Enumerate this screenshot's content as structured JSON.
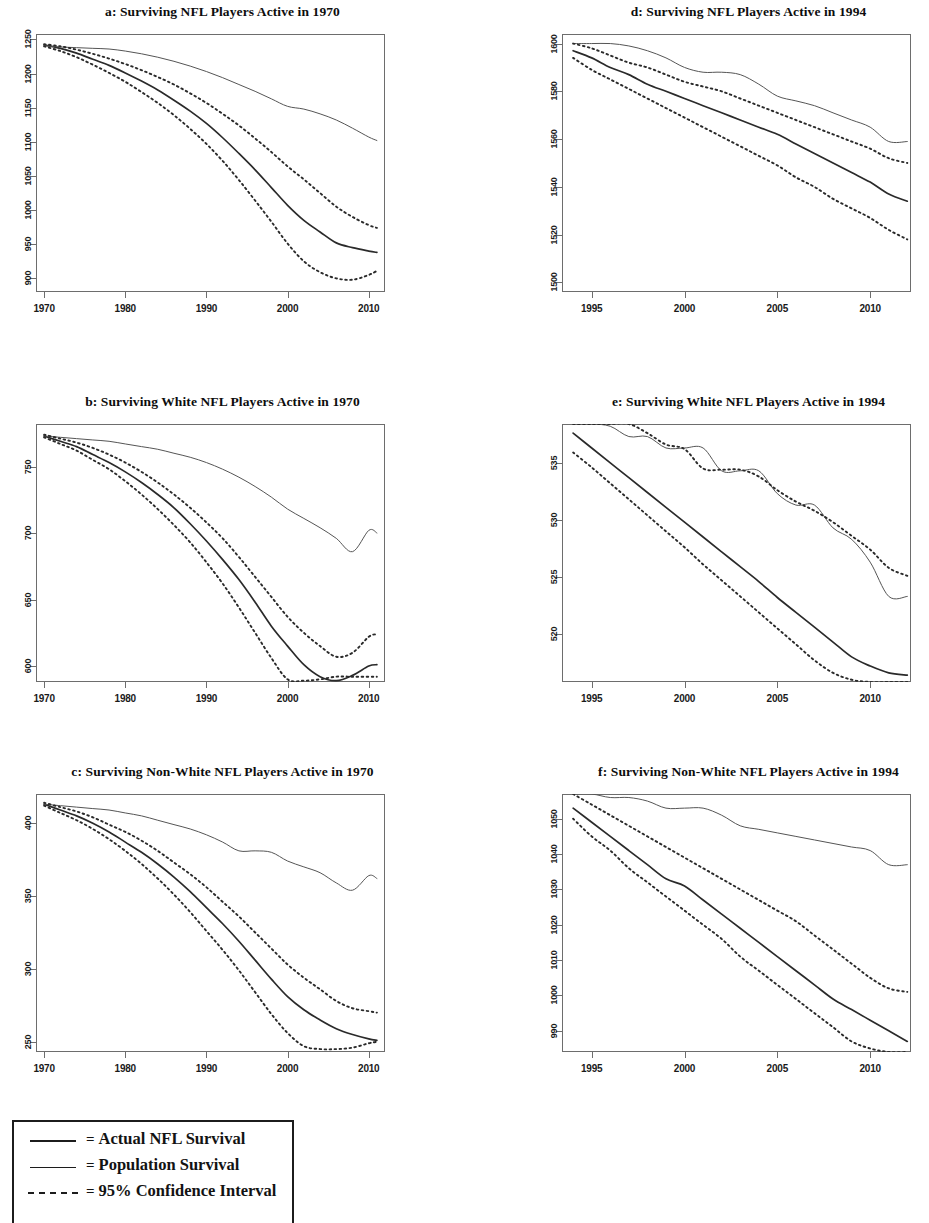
{
  "figure": {
    "panel_order": [
      "a",
      "b",
      "c",
      "d",
      "e",
      "f"
    ]
  },
  "legend": {
    "entries": [
      {
        "style": "solid-thick",
        "eq": "=",
        "label": "Actual NFL Survival"
      },
      {
        "style": "solid-thin",
        "eq": "=",
        "label": "Population Survival"
      },
      {
        "style": "dashed",
        "eq": "=",
        "label": "95% Confidence Interval"
      }
    ]
  },
  "chart_data": [
    {
      "id": "a",
      "type": "line",
      "title": "a: Surviving NFL Players Active in 1970",
      "xlabel": "",
      "ylabel": "",
      "grid": false,
      "legend_position": "external-below",
      "xlim": [
        1969,
        2012
      ],
      "ylim": [
        880,
        1258
      ],
      "xticks": [
        1970,
        1980,
        1990,
        2000,
        2010
      ],
      "yticks": [
        900,
        950,
        1000,
        1050,
        1100,
        1150,
        1200,
        1250
      ],
      "x": [
        1970,
        1972,
        1974,
        1976,
        1978,
        1980,
        1982,
        1984,
        1986,
        1988,
        1990,
        1992,
        1994,
        1996,
        1998,
        2000,
        2002,
        2004,
        2006,
        2008,
        2010,
        2011
      ],
      "series": [
        {
          "name": "Actual NFL Survival",
          "style": "solid-thick",
          "values": [
            1242,
            1237,
            1230,
            1221,
            1212,
            1201,
            1189,
            1176,
            1161,
            1145,
            1127,
            1106,
            1083,
            1059,
            1033,
            1007,
            985,
            968,
            952,
            945,
            940,
            938
          ]
        },
        {
          "name": "Population Survival",
          "style": "solid-thin",
          "values": [
            1241,
            1239,
            1238,
            1237,
            1236,
            1233,
            1229,
            1224,
            1218,
            1211,
            1203,
            1194,
            1184,
            1174,
            1163,
            1152,
            1148,
            1141,
            1132,
            1120,
            1107,
            1102
          ]
        },
        {
          "name": "95% CI upper",
          "style": "dashed",
          "values": [
            1243,
            1240,
            1235,
            1229,
            1222,
            1214,
            1205,
            1195,
            1184,
            1171,
            1157,
            1141,
            1124,
            1105,
            1085,
            1064,
            1045,
            1025,
            1005,
            990,
            978,
            974
          ]
        },
        {
          "name": "95% CI lower",
          "style": "dashed",
          "values": [
            1240,
            1233,
            1224,
            1213,
            1201,
            1188,
            1173,
            1157,
            1139,
            1119,
            1097,
            1072,
            1044,
            1014,
            983,
            951,
            925,
            909,
            900,
            898,
            905,
            911
          ]
        }
      ]
    },
    {
      "id": "b",
      "type": "line",
      "title": "b: Surviving White NFL Players Active in 1970",
      "xlabel": "",
      "ylabel": "",
      "grid": false,
      "legend_position": "external-below",
      "xlim": [
        1969,
        2012
      ],
      "ylim": [
        588,
        782
      ],
      "xticks": [
        1970,
        1980,
        1990,
        2000,
        2010
      ],
      "yticks": [
        600,
        650,
        700,
        750
      ],
      "x": [
        1970,
        1972,
        1974,
        1976,
        1978,
        1980,
        1982,
        1984,
        1986,
        1988,
        1990,
        1992,
        1994,
        1996,
        1998,
        2000,
        2002,
        2004,
        2006,
        2008,
        2010,
        2011
      ],
      "series": [
        {
          "name": "Actual NFL Survival",
          "style": "solid-thick",
          "values": [
            773,
            769,
            765,
            759,
            753,
            746,
            738,
            729,
            719,
            707,
            694,
            680,
            665,
            648,
            630,
            615,
            601,
            592,
            589,
            593,
            600,
            601
          ]
        },
        {
          "name": "Population Survival",
          "style": "solid-thin",
          "values": [
            773,
            772,
            771,
            770,
            769,
            767,
            765,
            763,
            760,
            757,
            753,
            748,
            742,
            735,
            727,
            718,
            711,
            704,
            696,
            686,
            702,
            700
          ]
        },
        {
          "name": "95% CI upper",
          "style": "dashed",
          "values": [
            774,
            771,
            768,
            764,
            759,
            753,
            746,
            738,
            729,
            719,
            708,
            696,
            682,
            667,
            652,
            637,
            625,
            615,
            607,
            610,
            622,
            624
          ]
        },
        {
          "name": "95% CI lower",
          "style": "dashed",
          "values": [
            772,
            767,
            762,
            755,
            748,
            739,
            729,
            718,
            706,
            693,
            678,
            662,
            644,
            625,
            606,
            590,
            589,
            590,
            592,
            592,
            592,
            592
          ]
        }
      ]
    },
    {
      "id": "c",
      "type": "line",
      "title": "c: Surviving Non-White NFL Players Active in 1970",
      "xlabel": "",
      "ylabel": "",
      "grid": false,
      "legend_position": "external-below",
      "xlim": [
        1969,
        2012
      ],
      "ylim": [
        243,
        420
      ],
      "xticks": [
        1970,
        1980,
        1990,
        2000,
        2010
      ],
      "yticks": [
        250,
        300,
        350,
        400
      ],
      "x": [
        1970,
        1972,
        1974,
        1976,
        1978,
        1980,
        1982,
        1984,
        1986,
        1988,
        1990,
        1992,
        1994,
        1996,
        1998,
        2000,
        2002,
        2004,
        2006,
        2008,
        2010,
        2011
      ],
      "series": [
        {
          "name": "Actual NFL Survival",
          "style": "solid-thick",
          "values": [
            413,
            409,
            405,
            400,
            394,
            387,
            380,
            372,
            363,
            353,
            342,
            331,
            319,
            306,
            293,
            281,
            272,
            265,
            259,
            255,
            252,
            251
          ]
        },
        {
          "name": "Population Survival",
          "style": "solid-thin",
          "values": [
            413,
            412,
            411,
            410,
            409,
            407,
            405,
            402,
            399,
            396,
            392,
            387,
            381,
            381,
            380,
            374,
            370,
            366,
            359,
            354,
            364,
            362
          ]
        },
        {
          "name": "95% CI upper",
          "style": "dashed",
          "values": [
            414,
            411,
            408,
            404,
            399,
            394,
            388,
            381,
            373,
            365,
            356,
            346,
            336,
            325,
            314,
            303,
            294,
            286,
            278,
            273,
            271,
            270
          ]
        },
        {
          "name": "95% CI lower",
          "style": "dashed",
          "values": [
            412,
            407,
            402,
            396,
            389,
            381,
            372,
            362,
            351,
            339,
            326,
            313,
            299,
            284,
            269,
            256,
            247,
            245,
            245,
            246,
            249,
            250
          ]
        }
      ]
    },
    {
      "id": "d",
      "type": "line",
      "title": "d: Surviving NFL Players Active in 1994",
      "xlabel": "",
      "ylabel": "",
      "grid": false,
      "legend_position": "external-below",
      "xlim": [
        1993.4,
        2012.2
      ],
      "ylim": [
        1496,
        1604
      ],
      "xticks": [
        1995,
        2000,
        2005,
        2010
      ],
      "yticks": [
        1500,
        1520,
        1540,
        1560,
        1580,
        1600
      ],
      "x": [
        1994,
        1995,
        1996,
        1997,
        1998,
        1999,
        2000,
        2001,
        2002,
        2003,
        2004,
        2005,
        2006,
        2007,
        2008,
        2009,
        2010,
        2011,
        2012
      ],
      "series": [
        {
          "name": "Actual NFL Survival",
          "style": "solid-thick",
          "values": [
            1597,
            1594,
            1590,
            1587,
            1583,
            1580,
            1577,
            1574,
            1571,
            1568,
            1565,
            1562,
            1558,
            1554,
            1550,
            1546,
            1542,
            1537,
            1534
          ]
        },
        {
          "name": "Population Survival",
          "style": "solid-thin",
          "values": [
            1600,
            1600,
            1600,
            1599,
            1597,
            1594,
            1590,
            1588,
            1588,
            1587,
            1583,
            1578,
            1576,
            1574,
            1571,
            1568,
            1565,
            1559,
            1559
          ]
        },
        {
          "name": "95% CI upper",
          "style": "dashed",
          "values": [
            1600,
            1598,
            1595,
            1592,
            1590,
            1587,
            1584,
            1582,
            1580,
            1577,
            1574,
            1571,
            1568,
            1565,
            1562,
            1559,
            1556,
            1552,
            1550
          ]
        },
        {
          "name": "95% CI lower",
          "style": "dashed",
          "values": [
            1594,
            1589,
            1585,
            1581,
            1577,
            1573,
            1569,
            1565,
            1561,
            1557,
            1553,
            1549,
            1544,
            1540,
            1535,
            1531,
            1527,
            1522,
            1518
          ]
        }
      ]
    },
    {
      "id": "e",
      "type": "line",
      "title": "e: Surviving White NFL Players Active in 1994",
      "xlabel": "",
      "ylabel": "",
      "grid": false,
      "legend_position": "external-below",
      "xlim": [
        1993.4,
        2012.2
      ],
      "ylim": [
        515.8,
        538.4
      ],
      "xticks": [
        1995,
        2000,
        2005,
        2010
      ],
      "yticks": [
        520,
        525,
        530,
        535
      ],
      "x": [
        1994,
        1995,
        1996,
        1997,
        1998,
        1999,
        2000,
        2001,
        2002,
        2003,
        2004,
        2005,
        2006,
        2007,
        2008,
        2009,
        2010,
        2011,
        2012
      ],
      "series": [
        {
          "name": "Actual NFL Survival",
          "style": "solid-thick",
          "values": [
            537.6,
            536.3,
            535.0,
            533.7,
            532.4,
            531.1,
            529.8,
            528.5,
            527.2,
            525.9,
            524.6,
            523.2,
            521.9,
            520.6,
            519.3,
            518.0,
            517.2,
            516.6,
            516.4
          ]
        },
        {
          "name": "Population Survival",
          "style": "solid-thin",
          "values": [
            538.4,
            538.4,
            538.2,
            537.3,
            537.3,
            536.3,
            536.3,
            536.3,
            534.3,
            534.3,
            534.3,
            532.3,
            531.3,
            531.3,
            529.3,
            528.3,
            526.3,
            523.3,
            523.3
          ]
        },
        {
          "name": "95% CI upper",
          "style": "dashed",
          "values": [
            538.4,
            538.4,
            538.4,
            538.4,
            537.6,
            536.6,
            536.2,
            534.5,
            534.4,
            534.4,
            533.8,
            532.6,
            531.6,
            530.8,
            529.8,
            528.6,
            527.4,
            525.8,
            525.1
          ]
        },
        {
          "name": "95% CI lower",
          "style": "dashed",
          "values": [
            535.9,
            534.6,
            533.2,
            531.8,
            530.4,
            529.0,
            527.6,
            526.1,
            524.7,
            523.3,
            521.9,
            520.5,
            519.1,
            517.7,
            516.6,
            516.0,
            515.8,
            515.8,
            515.8
          ]
        }
      ]
    },
    {
      "id": "f",
      "type": "line",
      "title": "f: Surviving Non-White NFL Players Active in 1994",
      "xlabel": "",
      "ylabel": "",
      "grid": false,
      "legend_position": "external-below",
      "xlim": [
        1993.4,
        2012.2
      ],
      "ylim": [
        984,
        1057
      ],
      "xticks": [
        1995,
        2000,
        2005,
        2010
      ],
      "yticks": [
        990,
        1000,
        1010,
        1020,
        1030,
        1040,
        1050
      ],
      "x": [
        1994,
        1995,
        1996,
        1997,
        1998,
        1999,
        2000,
        2001,
        2002,
        2003,
        2004,
        2005,
        2006,
        2007,
        2008,
        2009,
        2010,
        2011,
        2012
      ],
      "series": [
        {
          "name": "Actual NFL Survival",
          "style": "solid-thick",
          "values": [
            1053,
            1049,
            1045,
            1041,
            1037,
            1033,
            1031,
            1027,
            1023,
            1019,
            1015,
            1011,
            1007,
            1003,
            999,
            996,
            993,
            990,
            987
          ]
        },
        {
          "name": "Population Survival",
          "style": "solid-thin",
          "values": [
            1057,
            1057,
            1056,
            1056,
            1055,
            1053,
            1053,
            1053,
            1051,
            1048,
            1047,
            1046,
            1045,
            1044,
            1043,
            1042,
            1041,
            1037,
            1037
          ]
        },
        {
          "name": "95% CI upper",
          "style": "dashed",
          "values": [
            1057,
            1054,
            1051,
            1048,
            1045,
            1042,
            1039,
            1036,
            1033,
            1030,
            1027,
            1024,
            1021,
            1017,
            1013,
            1009,
            1005,
            1002,
            1001
          ]
        },
        {
          "name": "95% CI lower",
          "style": "dashed",
          "values": [
            1050,
            1045,
            1041,
            1036,
            1032,
            1028,
            1024,
            1020,
            1016,
            1011,
            1007,
            1003,
            999,
            995,
            991,
            987,
            985,
            984,
            984
          ]
        }
      ]
    }
  ]
}
